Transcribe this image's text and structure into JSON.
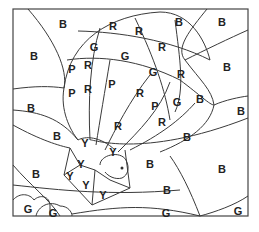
{
  "labels": [
    {
      "t": "B",
      "x": 63,
      "y": 24
    },
    {
      "t": "R",
      "x": 113,
      "y": 26
    },
    {
      "t": "B",
      "x": 179,
      "y": 22
    },
    {
      "t": "B",
      "x": 222,
      "y": 22
    },
    {
      "t": "B",
      "x": 34,
      "y": 56
    },
    {
      "t": "G",
      "x": 94,
      "y": 47
    },
    {
      "t": "R",
      "x": 139,
      "y": 31
    },
    {
      "t": "G",
      "x": 125,
      "y": 56
    },
    {
      "t": "R",
      "x": 162,
      "y": 47
    },
    {
      "t": "P",
      "x": 72,
      "y": 69
    },
    {
      "t": "R",
      "x": 88,
      "y": 65
    },
    {
      "t": "B",
      "x": 227,
      "y": 67
    },
    {
      "t": "P",
      "x": 72,
      "y": 93
    },
    {
      "t": "R",
      "x": 88,
      "y": 89
    },
    {
      "t": "P",
      "x": 112,
      "y": 84
    },
    {
      "t": "G",
      "x": 153,
      "y": 72
    },
    {
      "t": "R",
      "x": 181,
      "y": 74
    },
    {
      "t": "R",
      "x": 140,
      "y": 93
    },
    {
      "t": "P",
      "x": 155,
      "y": 106
    },
    {
      "t": "G",
      "x": 177,
      "y": 102
    },
    {
      "t": "B",
      "x": 200,
      "y": 99
    },
    {
      "t": "B",
      "x": 31,
      "y": 108
    },
    {
      "t": "B",
      "x": 241,
      "y": 111
    },
    {
      "t": "R",
      "x": 118,
      "y": 126
    },
    {
      "t": "R",
      "x": 162,
      "y": 122
    },
    {
      "t": "B",
      "x": 187,
      "y": 137
    },
    {
      "t": "Y",
      "x": 85,
      "y": 143
    },
    {
      "t": "Y",
      "x": 113,
      "y": 152
    },
    {
      "t": "Y",
      "x": 81,
      "y": 164
    },
    {
      "t": "B",
      "x": 57,
      "y": 136
    },
    {
      "t": "Y",
      "x": 70,
      "y": 176
    },
    {
      "t": "Y",
      "x": 86,
      "y": 185
    },
    {
      "t": "B",
      "x": 150,
      "y": 164
    },
    {
      "t": "B",
      "x": 222,
      "y": 169
    },
    {
      "t": "Y",
      "x": 103,
      "y": 195
    },
    {
      "t": "B",
      "x": 36,
      "y": 174
    },
    {
      "t": "B",
      "x": 167,
      "y": 190
    },
    {
      "t": "G",
      "x": 28,
      "y": 209
    },
    {
      "t": "G",
      "x": 53,
      "y": 213
    },
    {
      "t": "G",
      "x": 166,
      "y": 213
    },
    {
      "t": "G",
      "x": 238,
      "y": 211
    }
  ]
}
